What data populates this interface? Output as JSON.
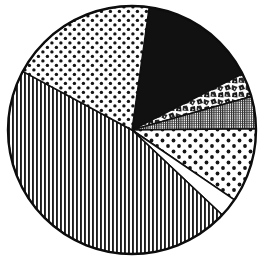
{
  "figure": {
    "kind": "pie-chart",
    "background_color": "#ffffff",
    "outline_color": "#0d0d0d",
    "center_x": 132,
    "center_y": 130,
    "radius": 124
  },
  "chart_data": {
    "type": "pie",
    "title": "",
    "subtitle": "",
    "xlabel": "",
    "ylabel": "",
    "legend_position": "none",
    "grid": false,
    "labels_shown": false,
    "total_degrees": 360,
    "start_angle_deg": -82,
    "direction": "clockwise",
    "categories": [
      "Segment 1",
      "Segment 2",
      "Segment 3",
      "Segment 4",
      "Segment 5",
      "Segment 6",
      "Segment 7"
    ],
    "values": [
      15.3,
      3.1,
      4.2,
      9.7,
      2.5,
      45.8,
      19.4
    ],
    "percentages": [
      15.3,
      3.1,
      4.2,
      9.7,
      2.5,
      45.8,
      19.4
    ],
    "angles_deg": [
      55.1,
      11.2,
      15.1,
      34.9,
      9.0,
      164.9,
      69.8
    ],
    "slices": [
      {
        "name": "Segment 1",
        "fill_style": "solid-black",
        "fill_color": "#111111",
        "percent": 15.3,
        "angle_deg": 55.1,
        "start_deg": -82.0,
        "end_deg": -26.9
      },
      {
        "name": "Segment 2",
        "fill_style": "mottled-scribble",
        "fill_color": "#2a2a2a",
        "percent": 3.1,
        "angle_deg": 11.2,
        "start_deg": -26.9,
        "end_deg": -15.7
      },
      {
        "name": "Segment 3",
        "fill_style": "fine-vertical-hatch",
        "fill_color": "#333333",
        "percent": 4.2,
        "angle_deg": 15.1,
        "start_deg": -15.7,
        "end_deg": -0.6
      },
      {
        "name": "Segment 4",
        "fill_style": "coarse-dots",
        "fill_color": "#1a1a1a",
        "percent": 9.7,
        "angle_deg": 34.9,
        "start_deg": -0.6,
        "end_deg": 34.3
      },
      {
        "name": "Segment 5",
        "fill_style": "blank-white",
        "fill_color": "#ffffff",
        "percent": 2.5,
        "angle_deg": 9.0,
        "start_deg": 34.3,
        "end_deg": 43.3
      },
      {
        "name": "Segment 6",
        "fill_style": "vertical-lines",
        "fill_color": "#242424",
        "percent": 45.8,
        "angle_deg": 164.9,
        "start_deg": 43.3,
        "end_deg": 208.2
      },
      {
        "name": "Segment 7",
        "fill_style": "medium-dots",
        "fill_color": "#1a1a1a",
        "percent": 19.4,
        "angle_deg": 69.8,
        "start_deg": 208.2,
        "end_deg": 278.0
      }
    ]
  }
}
